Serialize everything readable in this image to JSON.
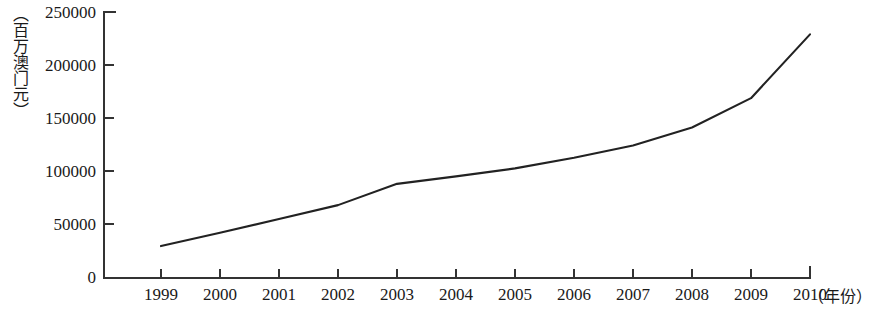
{
  "chart_data": {
    "type": "line",
    "title": "",
    "xlabel": "（年份）",
    "ylabel": "（百万澳门元）",
    "x": [
      1999,
      2000,
      2001,
      2002,
      2003,
      2004,
      2005,
      2006,
      2007,
      2008,
      2009,
      2010
    ],
    "categories": [
      "1999",
      "2000",
      "2001",
      "2002",
      "2003",
      "2004",
      "2005",
      "2006",
      "2007",
      "2008",
      "2009",
      "2010"
    ],
    "values": [
      30000,
      42500,
      55500,
      68500,
      88500,
      95500,
      103000,
      113000,
      124500,
      141500,
      169000,
      229000
    ],
    "series": [
      {
        "name": "",
        "values": [
          30000,
          42500,
          55500,
          68500,
          88500,
          95500,
          103000,
          113000,
          124500,
          141500,
          169000,
          229000
        ]
      }
    ],
    "ylim": [
      0,
      250000
    ],
    "y_ticks": [
      0,
      50000,
      100000,
      150000,
      200000,
      250000
    ],
    "y_tick_labels": [
      "0",
      "50000",
      "100000",
      "150000",
      "200000",
      "250000"
    ],
    "grid": false,
    "legend": "none",
    "line_color": "#222222",
    "axis_color": "#333333",
    "background_color": "#ffffff"
  }
}
